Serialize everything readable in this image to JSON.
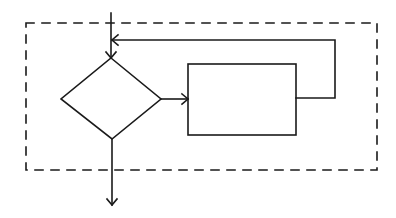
{
  "diagram": {
    "title": "",
    "type": "flowchart-loop",
    "colors": {
      "stroke": "#1a1a1a",
      "background": "#ffffff"
    },
    "nodes": [
      {
        "id": "loop-boundary",
        "shape": "dashed-rectangle",
        "label": ""
      },
      {
        "id": "decision",
        "shape": "diamond",
        "label": ""
      },
      {
        "id": "process",
        "shape": "rectangle",
        "label": ""
      }
    ],
    "edges": [
      {
        "from": "entry",
        "to": "decision",
        "label": ""
      },
      {
        "from": "decision",
        "to": "process",
        "label": ""
      },
      {
        "from": "process",
        "to": "decision",
        "label": "",
        "note": "feedback loop back to entry line"
      },
      {
        "from": "decision",
        "to": "exit",
        "label": ""
      }
    ]
  }
}
